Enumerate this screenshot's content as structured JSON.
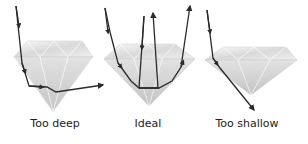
{
  "diagram": {
    "panels": [
      {
        "id": "too-deep",
        "label": "Too deep",
        "label_x": 55
      },
      {
        "id": "ideal",
        "label": "Ideal",
        "label_x": 148
      },
      {
        "id": "too-shallow",
        "label": "Too shallow",
        "label_x": 247
      }
    ],
    "colors": {
      "ray": "#2a2a2a",
      "diamond_light": "#f4f4f4",
      "diamond_mid": "#d8d8d8",
      "diamond_dark": "#b8b8b8",
      "text": "#222222"
    }
  }
}
